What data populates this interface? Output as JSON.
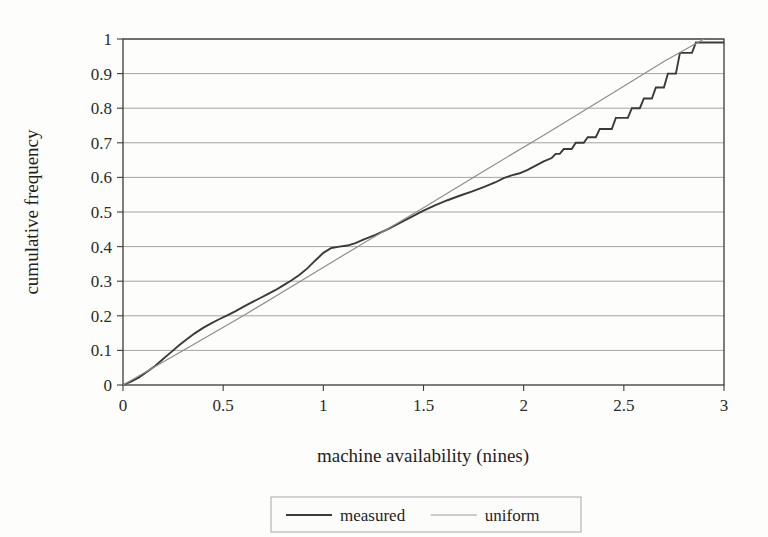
{
  "chart_data": {
    "type": "line",
    "title": "",
    "xlabel": "machine availability (nines)",
    "ylabel": "cumulative frequency",
    "xlim": [
      0,
      3
    ],
    "ylim": [
      0,
      1
    ],
    "xticks": [
      "0",
      "0.5",
      "1",
      "1.5",
      "2",
      "2.5",
      "3"
    ],
    "xtick_values": [
      0,
      0.5,
      1,
      1.5,
      2,
      2.5,
      3
    ],
    "yticks": [
      "0",
      "0.1",
      "0.2",
      "0.3",
      "0.4",
      "0.5",
      "0.6",
      "0.7",
      "0.8",
      "0.9",
      "1"
    ],
    "ytick_values": [
      0,
      0.1,
      0.2,
      0.3,
      0.4,
      0.5,
      0.6,
      0.7,
      0.8,
      0.9,
      1
    ],
    "grid": "horizontal",
    "legend_position": "below-center",
    "series": [
      {
        "name": "measured",
        "color": "#3a3a3a",
        "width": 1.9,
        "points": [
          [
            0.0,
            0.0
          ],
          [
            0.04,
            0.01
          ],
          [
            0.08,
            0.022
          ],
          [
            0.12,
            0.038
          ],
          [
            0.16,
            0.055
          ],
          [
            0.2,
            0.075
          ],
          [
            0.24,
            0.095
          ],
          [
            0.28,
            0.115
          ],
          [
            0.32,
            0.133
          ],
          [
            0.36,
            0.15
          ],
          [
            0.4,
            0.165
          ],
          [
            0.44,
            0.178
          ],
          [
            0.48,
            0.19
          ],
          [
            0.52,
            0.201
          ],
          [
            0.56,
            0.213
          ],
          [
            0.6,
            0.226
          ],
          [
            0.64,
            0.238
          ],
          [
            0.68,
            0.25
          ],
          [
            0.72,
            0.262
          ],
          [
            0.76,
            0.274
          ],
          [
            0.8,
            0.288
          ],
          [
            0.84,
            0.302
          ],
          [
            0.88,
            0.318
          ],
          [
            0.92,
            0.337
          ],
          [
            0.96,
            0.36
          ],
          [
            1.0,
            0.382
          ],
          [
            1.04,
            0.396
          ],
          [
            1.08,
            0.4
          ],
          [
            1.12,
            0.403
          ],
          [
            1.16,
            0.41
          ],
          [
            1.2,
            0.42
          ],
          [
            1.26,
            0.434
          ],
          [
            1.32,
            0.45
          ],
          [
            1.38,
            0.468
          ],
          [
            1.44,
            0.486
          ],
          [
            1.5,
            0.504
          ],
          [
            1.56,
            0.52
          ],
          [
            1.62,
            0.534
          ],
          [
            1.68,
            0.547
          ],
          [
            1.74,
            0.559
          ],
          [
            1.8,
            0.572
          ],
          [
            1.86,
            0.586
          ],
          [
            1.9,
            0.598
          ],
          [
            1.94,
            0.606
          ],
          [
            1.98,
            0.612
          ],
          [
            2.02,
            0.622
          ],
          [
            2.06,
            0.634
          ],
          [
            2.1,
            0.646
          ],
          [
            2.14,
            0.656
          ],
          [
            2.16,
            0.668
          ],
          [
            2.18,
            0.668
          ],
          [
            2.2,
            0.682
          ],
          [
            2.24,
            0.682
          ],
          [
            2.26,
            0.7
          ],
          [
            2.3,
            0.7
          ],
          [
            2.32,
            0.716
          ],
          [
            2.36,
            0.716
          ],
          [
            2.38,
            0.74
          ],
          [
            2.44,
            0.74
          ],
          [
            2.46,
            0.772
          ],
          [
            2.52,
            0.772
          ],
          [
            2.54,
            0.8
          ],
          [
            2.58,
            0.8
          ],
          [
            2.6,
            0.828
          ],
          [
            2.64,
            0.828
          ],
          [
            2.66,
            0.86
          ],
          [
            2.7,
            0.86
          ],
          [
            2.72,
            0.9
          ],
          [
            2.76,
            0.9
          ],
          [
            2.78,
            0.96
          ],
          [
            2.84,
            0.96
          ],
          [
            2.86,
            0.99
          ],
          [
            3.0,
            0.99
          ]
        ]
      },
      {
        "name": "uniform",
        "color": "#8d8d8d",
        "width": 1.2,
        "points": [
          [
            0.0,
            0.0
          ],
          [
            0.3,
            0.1
          ],
          [
            0.6,
            0.2
          ],
          [
            0.9,
            0.305
          ],
          [
            1.2,
            0.41
          ],
          [
            1.5,
            0.512
          ],
          [
            1.8,
            0.618
          ],
          [
            2.1,
            0.722
          ],
          [
            2.4,
            0.828
          ],
          [
            2.7,
            0.935
          ],
          [
            2.9,
            1.0
          ]
        ]
      }
    ]
  },
  "legend": {
    "entries": [
      {
        "label": "measured",
        "color": "#3a3a3a",
        "width": 2.2
      },
      {
        "label": "uniform",
        "color": "#9a9a9a",
        "width": 1.2
      }
    ]
  },
  "axes": {
    "frame_color": "#3b3b3b",
    "grid_color": "#9b9b9b",
    "background": "#fdfdfc"
  }
}
